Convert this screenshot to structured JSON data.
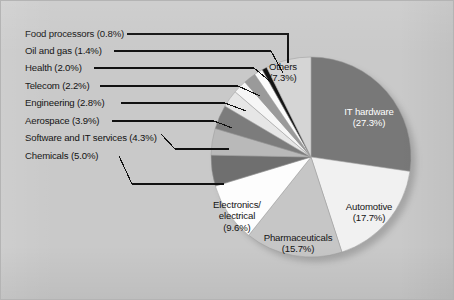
{
  "figure": {
    "background_color": "#c9c9c9",
    "border_color": "#b4b4b4"
  },
  "chart_data": {
    "type": "pie",
    "title": "",
    "subtitle": "",
    "xlabel": "",
    "ylabel": "",
    "legend_position": "none",
    "grid": false,
    "units": "percent",
    "total_percent": 100.0,
    "start_angle_deg": 0,
    "direction": "clockwise",
    "center_px": [
      310,
      156
    ],
    "radius_px": 100,
    "categories": [
      "IT hardware",
      "Automotive",
      "Pharmaceuticals",
      "Electronics/electrical",
      "Chemicals",
      "Software and IT services",
      "Aerospace",
      "Engineering",
      "Telecom",
      "Health",
      "Oil and gas",
      "Food processors",
      "Others"
    ],
    "values": [
      27.3,
      17.7,
      15.7,
      9.6,
      5.0,
      4.3,
      3.9,
      2.8,
      2.2,
      2.0,
      1.4,
      0.8,
      7.3
    ],
    "colors": [
      "#787878",
      "#f1f1f1",
      "#c6c6c6",
      "#fdfdfd",
      "#6f6f6f",
      "#b9b9b9",
      "#7c7c7c",
      "#e6e6e6",
      "#f6f6f6",
      "#9a9a9a",
      "#fbfbfb",
      "#141414",
      "#d5d5d5"
    ],
    "slices": [
      {
        "label": "IT hardware",
        "value": 27.3,
        "text": "IT hardware",
        "percent_text": "(27.3%)",
        "color": "#787878",
        "label_placement": "inside",
        "label_color": "#ffffff"
      },
      {
        "label": "Automotive",
        "value": 17.7,
        "text": "Automotive",
        "percent_text": "(17.7%)",
        "color": "#f1f1f1",
        "label_placement": "inside",
        "label_color": "#141414"
      },
      {
        "label": "Pharmaceuticals",
        "value": 15.7,
        "text": "Pharmaceuticals",
        "percent_text": "(15.7%)",
        "color": "#c6c6c6",
        "label_placement": "inside",
        "label_color": "#141414"
      },
      {
        "label": "Electronics/electrical",
        "value": 9.6,
        "text": "Electronics/|electrical",
        "percent_text": "(9.6%)",
        "color": "#fdfdfd",
        "label_placement": "inside",
        "label_color": "#141414"
      },
      {
        "label": "Chemicals",
        "value": 5.0,
        "text": "Chemicals",
        "percent_text": "(5.0%)",
        "color": "#6f6f6f",
        "label_placement": "leader",
        "label_color": "#111111"
      },
      {
        "label": "Software and IT services",
        "value": 4.3,
        "text": "Software and IT services",
        "percent_text": "(4.3%)",
        "color": "#b9b9b9",
        "label_placement": "leader",
        "label_color": "#111111"
      },
      {
        "label": "Aerospace",
        "value": 3.9,
        "text": "Aerospace",
        "percent_text": "(3.9%)",
        "color": "#7c7c7c",
        "label_placement": "leader",
        "label_color": "#111111"
      },
      {
        "label": "Engineering",
        "value": 2.8,
        "text": "Engineering",
        "percent_text": "(2.8%)",
        "color": "#e6e6e6",
        "label_placement": "leader",
        "label_color": "#111111"
      },
      {
        "label": "Telecom",
        "value": 2.2,
        "text": "Telecom",
        "percent_text": "(2.2%)",
        "color": "#f6f6f6",
        "label_placement": "leader",
        "label_color": "#111111"
      },
      {
        "label": "Health",
        "value": 2.0,
        "text": "Health",
        "percent_text": "(2.0%)",
        "color": "#9a9a9a",
        "label_placement": "leader",
        "label_color": "#111111"
      },
      {
        "label": "Oil and gas",
        "value": 1.4,
        "text": "Oil and gas",
        "percent_text": "(1.4%)",
        "color": "#fbfbfb",
        "label_placement": "leader",
        "label_color": "#111111"
      },
      {
        "label": "Food processors",
        "value": 0.8,
        "text": "Food processors",
        "percent_text": "(0.8%)",
        "color": "#141414",
        "label_placement": "leader",
        "label_color": "#111111"
      },
      {
        "label": "Others",
        "value": 7.3,
        "text": "Others",
        "percent_text": "(7.3%)",
        "color": "#d5d5d5",
        "label_placement": "inside",
        "label_color": "#141414"
      }
    ]
  },
  "leader_labels": [
    {
      "id": "food-processors",
      "text": "Food processors (0.8%)"
    },
    {
      "id": "oil-and-gas",
      "text": "Oil and gas (1.4%)"
    },
    {
      "id": "health",
      "text": "Health (2.0%)"
    },
    {
      "id": "telecom",
      "text": "Telecom (2.2%)"
    },
    {
      "id": "engineering",
      "text": "Engineering (2.8%)"
    },
    {
      "id": "aerospace",
      "text": "Aerospace (3.9%)"
    },
    {
      "id": "software-and-it-services",
      "text": "Software and IT services (4.3%)"
    },
    {
      "id": "chemicals",
      "text": "Chemicals (5.0%)"
    }
  ],
  "inside_labels": {
    "others": {
      "line1": "Others",
      "line2": "(7.3%)"
    },
    "it_hardware": {
      "line1": "IT hardware",
      "line2": "(27.3%)"
    },
    "automotive": {
      "line1": "Automotive",
      "line2": "(17.7%)"
    },
    "pharmaceuticals": {
      "line1": "Pharmaceuticals",
      "line2": "(15.7%)"
    },
    "electronics": {
      "line1": "Electronics/",
      "line2": "electrical",
      "line3": "(9.6%)"
    }
  }
}
